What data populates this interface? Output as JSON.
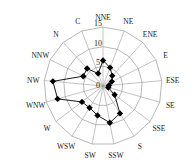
{
  "chart_data": {
    "type": "radar",
    "title": "",
    "categories": [
      "NNE",
      "NE",
      "ENE",
      "E",
      "ESE",
      "SE",
      "SSE",
      "S",
      "SSW",
      "SW",
      "WSW",
      "W",
      "WNW",
      "NW",
      "NNW",
      "N",
      "C"
    ],
    "series": [
      {
        "name": "frequency",
        "values": [
          6.5,
          5.0,
          3.5,
          2.5,
          1.5,
          1.4,
          3.7,
          8.2,
          9.5,
          7.6,
          6.5,
          6.7,
          12.0,
          12.8,
          5.6,
          6.0,
          3.4
        ],
        "color": "#000000",
        "marker": "diamond"
      }
    ],
    "rlim": [
      0,
      15
    ],
    "rticks": [
      0,
      5,
      10,
      15
    ],
    "rtick_labels": [
      "0",
      "5",
      "10",
      "15"
    ],
    "grid": true,
    "legend": null
  },
  "style": {
    "line_color": "#000000",
    "grid_color": "#9a9a9a",
    "label_color": "#222222"
  }
}
